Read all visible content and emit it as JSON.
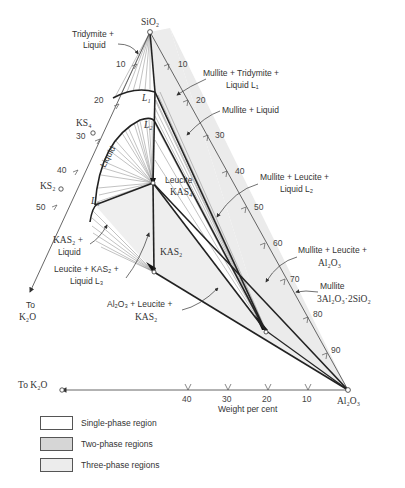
{
  "figure": {
    "axis_label": "Weight per cent",
    "vertices": {
      "top": "SiO₂",
      "right": "Al₂O₃",
      "left_arrow_label": "To K₂O",
      "bottom_arrow_label": "To K₂O"
    },
    "compounds": {
      "ks4": "KS₄",
      "ks2": "KS₂",
      "kas2": "KAS₂",
      "leucite_title": "Leucite",
      "leucite_formula": "KAS₄",
      "mullite_title": "Mullite",
      "mullite_formula": "3Al₂O₃·2SiO₂"
    },
    "points": {
      "l1": "L₁",
      "l2": "L₂",
      "l3": "L₃"
    },
    "left_ticks": [
      "10",
      "20",
      "30",
      "40",
      "50"
    ],
    "right_ticks": [
      "10",
      "20",
      "30",
      "40",
      "50",
      "60",
      "70",
      "80",
      "90"
    ],
    "bottom_ticks": [
      "40",
      "30",
      "20",
      "10"
    ],
    "region_labels": {
      "tridymite_liquid_1": "Tridymite +",
      "tridymite_liquid_2": "Liquid",
      "mullite_tridymite_liquid_1": "Mullite + Tridymite +",
      "mullite_tridymite_liquid_2": "Liquid L₁",
      "mullite_liquid": "Mullite + Liquid",
      "liquid": "Liquid",
      "mullite_leucite_liquid_1": "Mullite + Leucite +",
      "mullite_leucite_liquid_2": "Liquid L₂",
      "mullite_leucite_al2o3_1": "Mullite + Leucite +",
      "mullite_leucite_al2o3_2": "Al₂O₃",
      "kas2_liquid_1": "KAS₂ +",
      "kas2_liquid_2": "Liquid",
      "leucite_kas2_liquid_1": "Leucite + KAS₂ +",
      "leucite_kas2_liquid_2": "Liquid L₃",
      "al2o3_leucite_kas2_1": "Al₂O₃ + Leucite +",
      "al2o3_leucite_kas2_2": "KAS₂"
    }
  },
  "legend": [
    {
      "label": "Single-phase region",
      "fill": "#ffffff"
    },
    {
      "label": "Two-phase regions",
      "fill": "#d6d6d6"
    },
    {
      "label": "Three-phase regions",
      "fill": "#ececec"
    }
  ]
}
